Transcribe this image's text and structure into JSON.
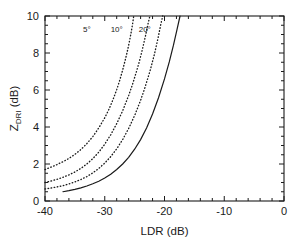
{
  "chart_data": {
    "type": "line",
    "title": "",
    "xlabel": "LDR   (dB)",
    "ylabel": "Z",
    "ylabel_sub": "DRI",
    "ylabel_unit": "(dB)",
    "xlim": [
      -40,
      0
    ],
    "ylim": [
      0,
      10
    ],
    "xticks": [
      -40,
      -30,
      -20,
      -10,
      0
    ],
    "xticklabels": [
      "-40",
      "-30",
      "-20",
      "-10",
      "0"
    ],
    "yticks": [
      0,
      2,
      4,
      6,
      8,
      10
    ],
    "yticklabels": [
      "0",
      "2",
      "4",
      "6",
      "8",
      "10"
    ],
    "x_minor_tick_step": 2,
    "y_minor_tick_step": 0.5,
    "grid": false,
    "legend_position": "inline-curve-labels",
    "series": [
      {
        "name": "5°",
        "label": "5°",
        "style": "dotted",
        "label_x": -33.0,
        "label_y": 9.15,
        "points": [
          [
            -40.0,
            1.7
          ],
          [
            -39.0,
            1.83
          ],
          [
            -38.0,
            1.97
          ],
          [
            -37.0,
            2.12
          ],
          [
            -36.0,
            2.3
          ],
          [
            -35.0,
            2.52
          ],
          [
            -34.0,
            2.78
          ],
          [
            -33.0,
            3.1
          ],
          [
            -32.0,
            3.48
          ],
          [
            -31.0,
            3.95
          ],
          [
            -30.0,
            4.5
          ],
          [
            -29.5,
            4.82
          ],
          [
            -29.0,
            5.18
          ],
          [
            -28.5,
            5.58
          ],
          [
            -28.0,
            6.02
          ],
          [
            -27.5,
            6.52
          ],
          [
            -27.0,
            7.08
          ],
          [
            -26.6,
            7.58
          ],
          [
            -26.2,
            8.12
          ],
          [
            -25.9,
            8.58
          ],
          [
            -25.6,
            9.08
          ],
          [
            -25.35,
            9.55
          ],
          [
            -25.15,
            10.0
          ]
        ]
      },
      {
        "name": "10°",
        "label": "10°",
        "style": "dotted",
        "label_x": -28.0,
        "label_y": 9.15,
        "points": [
          [
            -40.0,
            1.0
          ],
          [
            -39.0,
            1.08
          ],
          [
            -38.0,
            1.17
          ],
          [
            -37.0,
            1.28
          ],
          [
            -36.0,
            1.41
          ],
          [
            -35.0,
            1.57
          ],
          [
            -34.0,
            1.76
          ],
          [
            -33.0,
            2.0
          ],
          [
            -32.0,
            2.29
          ],
          [
            -31.0,
            2.64
          ],
          [
            -30.0,
            3.07
          ],
          [
            -29.0,
            3.58
          ],
          [
            -28.0,
            4.18
          ],
          [
            -27.0,
            4.88
          ],
          [
            -26.0,
            5.7
          ],
          [
            -25.4,
            6.26
          ],
          [
            -24.8,
            6.88
          ],
          [
            -24.2,
            7.56
          ],
          [
            -23.7,
            8.2
          ],
          [
            -23.2,
            8.9
          ],
          [
            -22.8,
            9.52
          ],
          [
            -22.45,
            10.0
          ]
        ]
      },
      {
        "name": "20°",
        "label": "20°",
        "style": "dotted",
        "label_x": -23.3,
        "label_y": 9.15,
        "points": [
          [
            -40.0,
            0.65
          ],
          [
            -39.0,
            0.7
          ],
          [
            -38.0,
            0.76
          ],
          [
            -37.0,
            0.83
          ],
          [
            -36.0,
            0.92
          ],
          [
            -35.0,
            1.03
          ],
          [
            -34.0,
            1.16
          ],
          [
            -33.0,
            1.32
          ],
          [
            -32.0,
            1.52
          ],
          [
            -31.0,
            1.76
          ],
          [
            -30.0,
            2.05
          ],
          [
            -29.0,
            2.4
          ],
          [
            -28.0,
            2.82
          ],
          [
            -27.0,
            3.32
          ],
          [
            -26.0,
            3.92
          ],
          [
            -25.0,
            4.62
          ],
          [
            -24.0,
            5.44
          ],
          [
            -23.2,
            6.2
          ],
          [
            -22.4,
            7.06
          ],
          [
            -21.7,
            7.92
          ],
          [
            -21.1,
            8.78
          ],
          [
            -20.6,
            9.58
          ],
          [
            -20.3,
            10.0
          ]
        ]
      },
      {
        "name": "solid",
        "label": "",
        "style": "solid",
        "points": [
          [
            -37.0,
            0.5
          ],
          [
            -36.0,
            0.56
          ],
          [
            -35.0,
            0.63
          ],
          [
            -34.0,
            0.71
          ],
          [
            -33.0,
            0.81
          ],
          [
            -32.0,
            0.93
          ],
          [
            -31.0,
            1.07
          ],
          [
            -30.0,
            1.24
          ],
          [
            -29.0,
            1.45
          ],
          [
            -28.0,
            1.7
          ],
          [
            -27.0,
            2.0
          ],
          [
            -26.0,
            2.36
          ],
          [
            -25.0,
            2.8
          ],
          [
            -24.0,
            3.32
          ],
          [
            -23.0,
            3.95
          ],
          [
            -22.0,
            4.7
          ],
          [
            -21.0,
            5.58
          ],
          [
            -20.0,
            6.6
          ],
          [
            -19.2,
            7.52
          ],
          [
            -18.5,
            8.42
          ],
          [
            -17.9,
            9.28
          ],
          [
            -17.4,
            10.0
          ]
        ]
      }
    ]
  }
}
